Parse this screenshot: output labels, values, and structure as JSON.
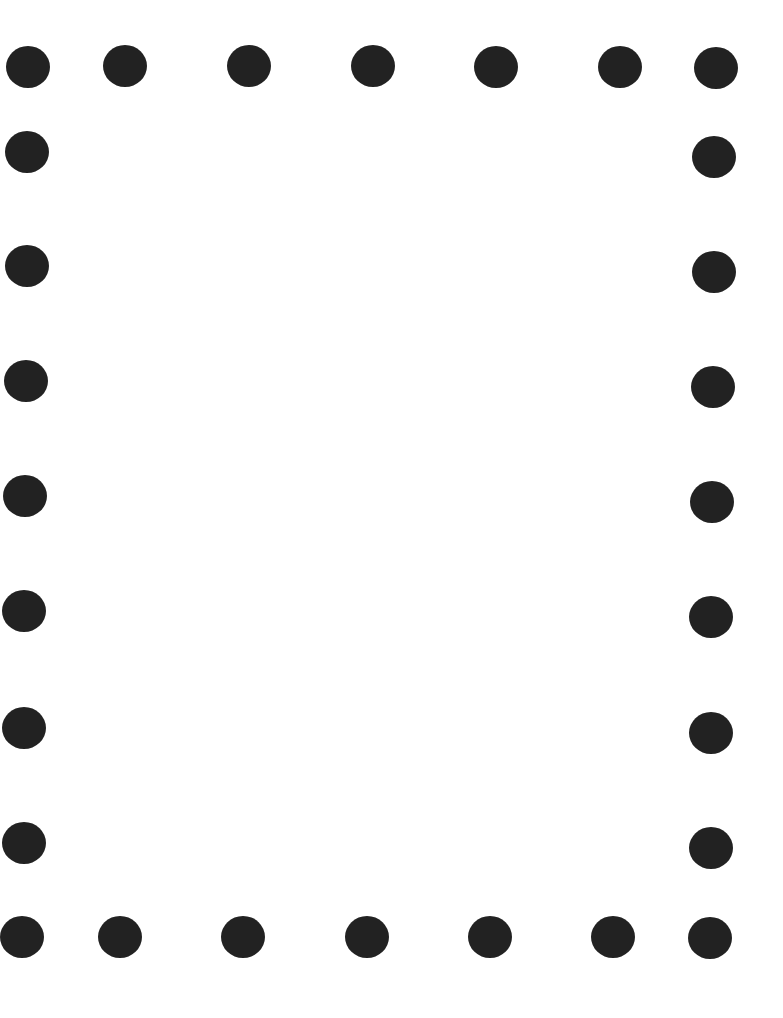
{
  "page": {
    "background": "#ffffff"
  },
  "border": {
    "dot_color": "#222222",
    "dot_diameter": 43,
    "dots": [
      {
        "x": 28,
        "y": 67
      },
      {
        "x": 125,
        "y": 66
      },
      {
        "x": 249,
        "y": 66
      },
      {
        "x": 373,
        "y": 66
      },
      {
        "x": 496,
        "y": 67
      },
      {
        "x": 620,
        "y": 67
      },
      {
        "x": 716,
        "y": 68
      },
      {
        "x": 27,
        "y": 152
      },
      {
        "x": 27,
        "y": 266
      },
      {
        "x": 26,
        "y": 381
      },
      {
        "x": 25,
        "y": 496
      },
      {
        "x": 24,
        "y": 611
      },
      {
        "x": 24,
        "y": 728
      },
      {
        "x": 24,
        "y": 843
      },
      {
        "x": 714,
        "y": 157
      },
      {
        "x": 714,
        "y": 272
      },
      {
        "x": 713,
        "y": 387
      },
      {
        "x": 712,
        "y": 502
      },
      {
        "x": 711,
        "y": 617
      },
      {
        "x": 711,
        "y": 733
      },
      {
        "x": 711,
        "y": 848
      },
      {
        "x": 22,
        "y": 937
      },
      {
        "x": 120,
        "y": 937
      },
      {
        "x": 243,
        "y": 937
      },
      {
        "x": 367,
        "y": 937
      },
      {
        "x": 490,
        "y": 937
      },
      {
        "x": 613,
        "y": 937
      },
      {
        "x": 710,
        "y": 938
      }
    ]
  }
}
